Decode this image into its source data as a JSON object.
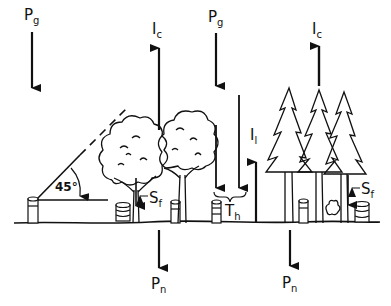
{
  "diagram": {
    "labels": {
      "gross_precip_left": {
        "main": "P",
        "sub": "g"
      },
      "gross_precip_mid": {
        "main": "P",
        "sub": "g"
      },
      "canopy_interception_left": {
        "main": "I",
        "sub": "c"
      },
      "canopy_interception_right": {
        "main": "I",
        "sub": "c"
      },
      "litter_interception": {
        "main": "I",
        "sub": "l"
      },
      "throughfall": {
        "main": "T",
        "sub": "h"
      },
      "stemflow_left": {
        "main": "S",
        "sub": "f"
      },
      "stemflow_right": {
        "main": "S",
        "sub": "f"
      },
      "net_precip_left": {
        "main": "P",
        "sub": "n"
      },
      "net_precip_right": {
        "main": "P",
        "sub": "n"
      },
      "angle": "45°"
    },
    "colors": {
      "ink": "#111111",
      "background": "#ffffff"
    }
  }
}
